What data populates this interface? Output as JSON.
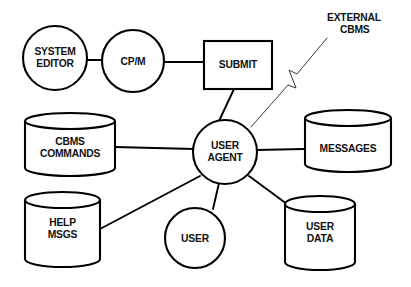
{
  "diagram": {
    "background_color": "#ffffff",
    "stroke_color": "#000000",
    "nodes": [
      {
        "id": "system-editor",
        "shape": "circle",
        "label_lines": [
          "SYSTEM",
          "EDITOR"
        ],
        "cx": 55,
        "cy": 58,
        "r": 32
      },
      {
        "id": "cpm",
        "shape": "circle",
        "label_lines": [
          "CP/M"
        ],
        "cx": 133,
        "cy": 61,
        "r": 31
      },
      {
        "id": "submit",
        "shape": "rectangle",
        "label_lines": [
          "SUBMIT"
        ],
        "x": 204,
        "y": 41,
        "w": 68,
        "h": 48
      },
      {
        "id": "cbms-commands",
        "shape": "cylinder",
        "label_lines": [
          "CBMS",
          "COMMANDS"
        ],
        "x": 25,
        "y": 113,
        "w": 90,
        "h": 63
      },
      {
        "id": "user-agent",
        "shape": "circle",
        "label_lines": [
          "USER",
          "AGENT"
        ],
        "cx": 225,
        "cy": 152,
        "r": 32
      },
      {
        "id": "messages",
        "shape": "cylinder",
        "label_lines": [
          "MESSAGES"
        ],
        "x": 304,
        "y": 110,
        "w": 87,
        "h": 62
      },
      {
        "id": "help-msgs",
        "shape": "cylinder",
        "label_lines": [
          "HELP",
          "MSGS"
        ],
        "x": 25,
        "y": 192,
        "w": 75,
        "h": 75
      },
      {
        "id": "user",
        "shape": "circle",
        "label_lines": [
          "USER"
        ],
        "cx": 195,
        "cy": 238,
        "r": 30
      },
      {
        "id": "user-data",
        "shape": "cylinder",
        "label_lines": [
          "USER",
          "DATA"
        ],
        "x": 285,
        "y": 196,
        "w": 70,
        "h": 74
      }
    ],
    "annotations": [
      {
        "id": "external-cbms",
        "label_lines": [
          "EXTERNAL",
          "CBMS"
        ],
        "x": 327,
        "y": 21,
        "line_style": "zigzag-break",
        "connects_to": "user-agent"
      }
    ],
    "connections": [
      {
        "from": "system-editor",
        "to": "cpm",
        "style": "solid"
      },
      {
        "from": "cpm",
        "to": "submit",
        "style": "solid"
      },
      {
        "from": "submit",
        "to": "user-agent",
        "style": "solid"
      },
      {
        "from": "cbms-commands",
        "to": "user-agent",
        "style": "solid"
      },
      {
        "from": "user-agent",
        "to": "messages",
        "style": "solid"
      },
      {
        "from": "help-msgs",
        "to": "user-agent",
        "style": "solid"
      },
      {
        "from": "user",
        "to": "user-agent",
        "style": "solid"
      },
      {
        "from": "user-agent",
        "to": "user-data",
        "style": "solid"
      },
      {
        "from": "external-cbms",
        "to": "user-agent",
        "style": "thin-zigzag"
      }
    ]
  }
}
